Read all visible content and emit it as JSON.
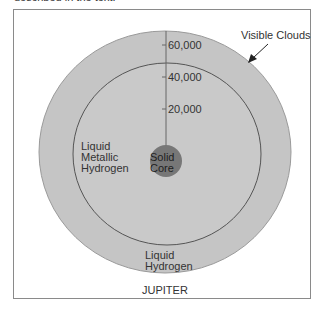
{
  "caption": "described in the text.",
  "diagram": {
    "title": "JUPITER",
    "axis_ticks": [
      "60,000",
      "40,000",
      "20,000"
    ],
    "callout": "Visible Clouds",
    "layers": {
      "outer": [
        "Liquid",
        "Hydrogen"
      ],
      "middle": [
        "Liquid",
        "Metallic",
        "Hydrogen"
      ],
      "core": [
        "Solid",
        "Core"
      ]
    },
    "colors": {
      "outer_fill": "#c4c4c4",
      "inner_fill": "#c9c9c9",
      "core_fill": "#767676",
      "line": "#555555"
    }
  }
}
